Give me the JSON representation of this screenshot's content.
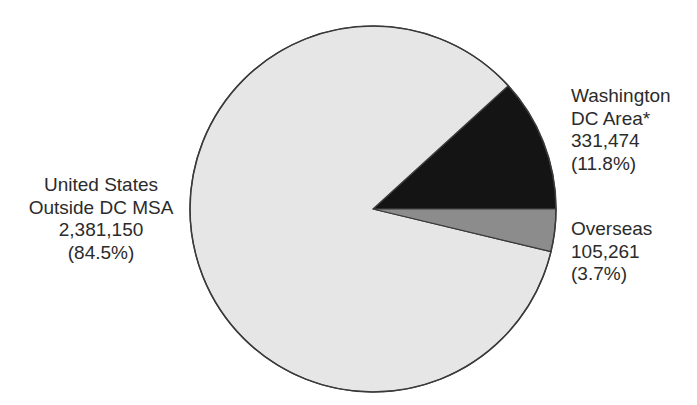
{
  "chart_data": {
    "type": "pie",
    "title": "",
    "center": [
      373,
      209
    ],
    "radius": 183,
    "start_angle_deg": 0,
    "direction": "counterclockwise",
    "slices": [
      {
        "name": "Washington DC Area*",
        "label_line1": "Washington",
        "label_line2": "DC Area*",
        "value": 331474,
        "value_text": "331,474",
        "percent": 11.8,
        "percent_text": "(11.8%)",
        "color": "#141414"
      },
      {
        "name": "United States Outside DC MSA",
        "label_line1": "United States",
        "label_line2": "Outside DC MSA",
        "value": 2381150,
        "value_text": "2,381,150",
        "percent": 84.5,
        "percent_text": "(84.5%)",
        "color": "#e6e6e6"
      },
      {
        "name": "Overseas",
        "label_line1": "Overseas",
        "value": 105261,
        "value_text": "105,261",
        "percent": 3.7,
        "percent_text": "(3.7%)",
        "color": "#8c8c8c"
      }
    ],
    "outline_color": "#3a3a3a",
    "legend": "none (direct labels)"
  }
}
